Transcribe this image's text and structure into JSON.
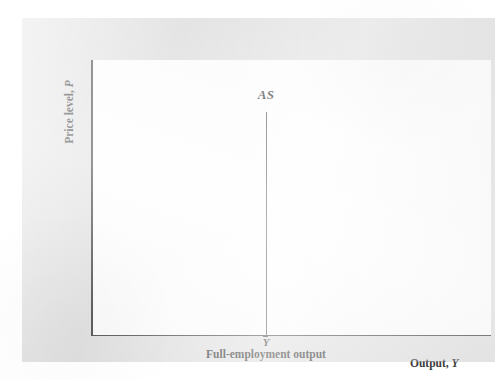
{
  "figure": {
    "kind": "aggregate-supply-diagram",
    "background_color": "#ffffff",
    "panel_color": "#e3e3e3",
    "plot_color": "#fefefe",
    "axis_color": "#4e4e4e",
    "curve_color": "#5a5a5a"
  },
  "labels": {
    "curve": "AS",
    "y_axis_text": "Price level, ",
    "y_axis_symbol": "P",
    "x_axis_text": "Output, ",
    "x_axis_symbol": "Y",
    "tick_symbol": "Y",
    "tick_caption": "Full-employment output"
  },
  "chart_data": {
    "type": "line",
    "title": "",
    "subtitle": "",
    "xlabel": "Output, Y",
    "ylabel": "Price level, P",
    "xlim": [
      0,
      1
    ],
    "ylim": [
      0,
      1
    ],
    "grid": false,
    "legend": "none",
    "axis_ticks": {
      "x": [
        "Y"
      ],
      "y": []
    },
    "annotations": [
      {
        "text": "AS",
        "x": 0.437,
        "y": 0.82,
        "style": "italic"
      },
      {
        "text": "Y",
        "x": 0.437,
        "y": -0.02,
        "style": "italic-overbar"
      },
      {
        "text": "Full-employment output",
        "x": 0.437,
        "y": -0.07,
        "style": "bold"
      }
    ],
    "series": [
      {
        "name": "AS",
        "description": "Vertical long-run aggregate supply curve at full-employment output",
        "x": [
          0.437,
          0.437
        ],
        "y": [
          0.0,
          0.81
        ]
      }
    ]
  }
}
